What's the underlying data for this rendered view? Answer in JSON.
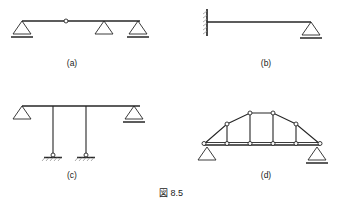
{
  "figure": {
    "caption": "図 8.5",
    "caption_x": 171,
    "caption_y": 194,
    "line_color": "#262626",
    "node_fill": "#ffffff",
    "hatch_color": "#8a8a8a",
    "background": "#ffffff",
    "width": 341,
    "height": 208
  },
  "panels": [
    {
      "id": "a",
      "label": "(a)",
      "label_x": 72,
      "label_y": 64,
      "description": "Continuous beam with internal hinge on three supports",
      "beam": {
        "x1": 22,
        "y1": 21,
        "x2": 140,
        "y2": 21
      },
      "hinge": {
        "cx": 66,
        "cy": 21,
        "r": 2.0
      },
      "supports": [
        {
          "type": "pin-triangle-hatched",
          "apex_x": 22,
          "apex_y": 21,
          "half_width": 9,
          "height": 13,
          "base_line": true,
          "hatched": true
        },
        {
          "type": "pin-triangle",
          "apex_x": 104,
          "apex_y": 21,
          "half_width": 9,
          "height": 13,
          "base_line": false,
          "hatched": false
        },
        {
          "type": "roller-triangle-hatched",
          "apex_x": 138,
          "apex_y": 21,
          "half_width": 9,
          "height": 13,
          "base_line": true,
          "hatched": true
        }
      ]
    },
    {
      "id": "b",
      "label": "(b)",
      "label_x": 266,
      "label_y": 64,
      "description": "Propped cantilever: fixed wall support at left, roller at right",
      "beam": {
        "x1": 208,
        "y1": 22,
        "x2": 311,
        "y2": 22
      },
      "wall": {
        "x": 207,
        "y_top": 9,
        "y_bottom": 36
      },
      "supports": [
        {
          "type": "fixed-wall",
          "x": 207,
          "y_top": 9,
          "y_bottom": 36
        },
        {
          "type": "roller-triangle-hatched",
          "apex_x": 311,
          "apex_y": 22,
          "half_width": 9,
          "height": 13,
          "base_line": true,
          "hatched": true
        }
      ]
    },
    {
      "id": "c",
      "label": "(c)",
      "label_x": 72,
      "label_y": 176,
      "description": "Beam supported on two pinned columns with end triangle supports",
      "beam": {
        "x1": 22,
        "y1": 106,
        "x2": 140,
        "y2": 106
      },
      "columns": [
        {
          "x": 53,
          "y_top": 106,
          "y_bottom": 154
        },
        {
          "x": 86,
          "y_top": 106,
          "y_bottom": 154
        }
      ],
      "column_bases": [
        {
          "cx": 53,
          "cy": 155,
          "r": 2.0,
          "ground_x1": 44,
          "ground_x2": 62,
          "ground_y": 157
        },
        {
          "cx": 86,
          "cy": 155,
          "r": 2.0,
          "ground_x1": 77,
          "ground_x2": 95,
          "ground_y": 157
        }
      ],
      "supports": [
        {
          "type": "pin-triangle",
          "apex_x": 22,
          "apex_y": 106,
          "half_width": 9,
          "height": 13,
          "base_line": false,
          "hatched": false
        },
        {
          "type": "roller-triangle-hatched",
          "apex_x": 134,
          "apex_y": 106,
          "half_width": 9,
          "height": 13,
          "base_line": true,
          "hatched": true
        }
      ]
    },
    {
      "id": "d",
      "label": "(d)",
      "label_x": 266,
      "label_y": 176,
      "description": "Camelback / bowstring truss with pin and roller supports",
      "bottom_chord": {
        "x1": 204,
        "y1": 145,
        "x2": 320,
        "y2": 145
      },
      "bottom_nodes": [
        {
          "cx": 204,
          "cy": 145
        },
        {
          "cx": 227,
          "cy": 145
        },
        {
          "cx": 250,
          "cy": 145
        },
        {
          "cx": 273,
          "cy": 145
        },
        {
          "cx": 296,
          "cy": 145
        },
        {
          "cx": 320,
          "cy": 145
        }
      ],
      "top_nodes": [
        {
          "cx": 227,
          "cy": 124
        },
        {
          "cx": 250,
          "cy": 113
        },
        {
          "cx": 273,
          "cy": 113
        },
        {
          "cx": 296,
          "cy": 124
        }
      ],
      "top_chord_path": [
        {
          "x": 204,
          "y": 145
        },
        {
          "x": 227,
          "y": 124
        },
        {
          "x": 250,
          "y": 113
        },
        {
          "x": 273,
          "y": 113
        },
        {
          "x": 296,
          "y": 124
        },
        {
          "x": 320,
          "y": 145
        }
      ],
      "verticals": [
        {
          "x1": 227,
          "y1": 124,
          "x2": 227,
          "y2": 145
        },
        {
          "x1": 250,
          "y1": 113,
          "x2": 250,
          "y2": 145
        },
        {
          "x1": 273,
          "y1": 113,
          "x2": 273,
          "y2": 145
        },
        {
          "x1": 296,
          "y1": 124,
          "x2": 296,
          "y2": 145
        }
      ],
      "supports": [
        {
          "type": "pin-triangle",
          "apex_x": 209,
          "apex_y": 148,
          "half_width": 9,
          "height": 13,
          "base_line": false,
          "hatched": false
        },
        {
          "type": "roller-triangle-hatched",
          "apex_x": 315,
          "apex_y": 148,
          "half_width": 9,
          "height": 13,
          "base_line": true,
          "hatched": true
        }
      ]
    }
  ]
}
